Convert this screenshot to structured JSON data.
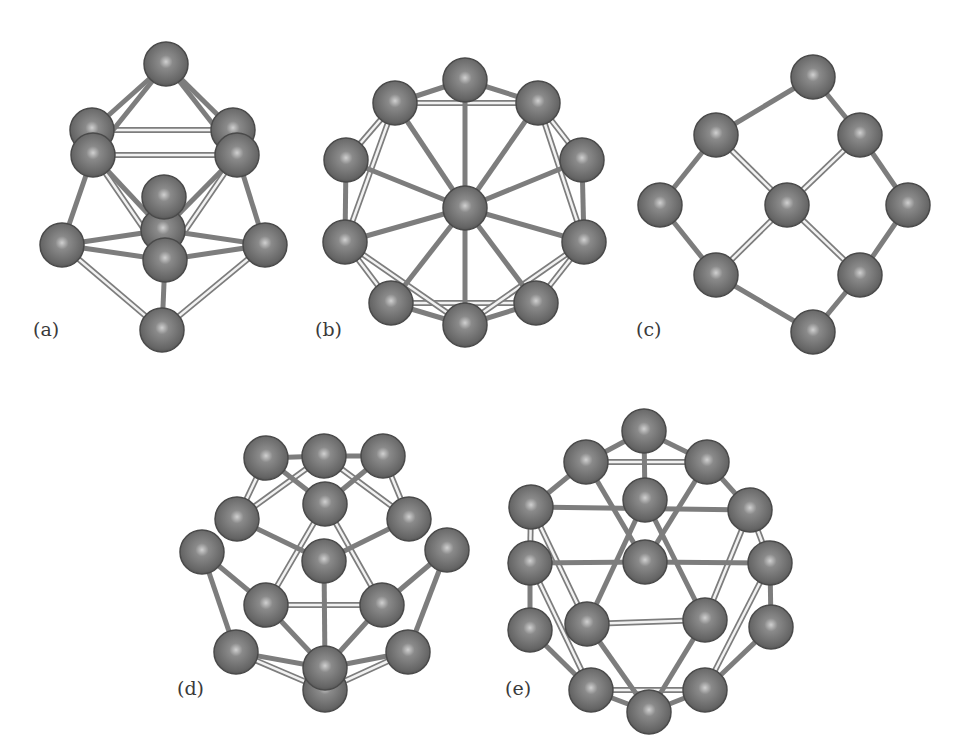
{
  "figure": {
    "colors": {
      "background": "#ffffff",
      "atom_fill": "#6f6f6f",
      "atom_edge": "#4a4a4a",
      "atom_highlight": "#c8c8c8",
      "bond_dark": "#7d7d7d",
      "bond_light": "#bdbdbd",
      "label": "#3a3a3a"
    },
    "atom_radius": 22,
    "panels": [
      {
        "id": "a",
        "label": "(a)",
        "label_pos": [
          33,
          332
        ],
        "atoms": [
          [
            166,
            64
          ],
          [
            92,
            130
          ],
          [
            233,
            130
          ],
          [
            93,
            155
          ],
          [
            237,
            155
          ],
          [
            163,
            230
          ],
          [
            164,
            197
          ],
          [
            62,
            245
          ],
          [
            265,
            245
          ],
          [
            165,
            260
          ],
          [
            162,
            330
          ]
        ],
        "bonds_dark": [
          [
            0,
            3
          ],
          [
            0,
            4
          ],
          [
            0,
            1
          ],
          [
            0,
            2
          ],
          [
            3,
            7
          ],
          [
            4,
            8
          ],
          [
            7,
            9
          ],
          [
            8,
            9
          ],
          [
            7,
            5
          ],
          [
            8,
            5
          ],
          [
            9,
            10
          ],
          [
            3,
            5
          ],
          [
            4,
            5
          ]
        ],
        "bonds_light": [
          [
            1,
            2
          ],
          [
            3,
            4
          ],
          [
            3,
            9
          ],
          [
            4,
            9
          ],
          [
            7,
            10
          ],
          [
            8,
            10
          ]
        ]
      },
      {
        "id": "b",
        "label": "(b)",
        "label_pos": [
          315,
          332
        ],
        "atoms": [
          [
            465,
            208
          ],
          [
            465,
            80
          ],
          [
            395,
            103
          ],
          [
            538,
            103
          ],
          [
            346,
            160
          ],
          [
            582,
            160
          ],
          [
            345,
            242
          ],
          [
            584,
            242
          ],
          [
            391,
            303
          ],
          [
            536,
            303
          ],
          [
            465,
            325
          ]
        ],
        "bonds_dark": [
          [
            0,
            1
          ],
          [
            0,
            2
          ],
          [
            0,
            3
          ],
          [
            0,
            4
          ],
          [
            0,
            5
          ],
          [
            0,
            6
          ],
          [
            0,
            7
          ],
          [
            0,
            8
          ],
          [
            0,
            9
          ],
          [
            0,
            10
          ],
          [
            1,
            2
          ],
          [
            1,
            3
          ],
          [
            4,
            6
          ],
          [
            5,
            7
          ],
          [
            8,
            10
          ],
          [
            9,
            10
          ]
        ],
        "bonds_light": [
          [
            2,
            3
          ],
          [
            2,
            4
          ],
          [
            3,
            5
          ],
          [
            6,
            8
          ],
          [
            7,
            9
          ],
          [
            8,
            9
          ],
          [
            2,
            6
          ],
          [
            3,
            7
          ],
          [
            6,
            10
          ],
          [
            7,
            10
          ]
        ]
      },
      {
        "id": "c",
        "label": "(c)",
        "label_pos": [
          636,
          332
        ],
        "atoms": [
          [
            813,
            77
          ],
          [
            716,
            135
          ],
          [
            860,
            135
          ],
          [
            660,
            205
          ],
          [
            908,
            205
          ],
          [
            787,
            205
          ],
          [
            716,
            275
          ],
          [
            860,
            275
          ],
          [
            813,
            332
          ]
        ],
        "bonds_dark": [
          [
            0,
            1
          ],
          [
            0,
            2
          ],
          [
            1,
            3
          ],
          [
            2,
            4
          ],
          [
            3,
            6
          ],
          [
            4,
            7
          ],
          [
            6,
            8
          ],
          [
            7,
            8
          ]
        ],
        "bonds_light": [
          [
            1,
            5
          ],
          [
            2,
            5
          ],
          [
            6,
            5
          ],
          [
            7,
            5
          ]
        ]
      },
      {
        "id": "d",
        "label": "(d)",
        "label_pos": [
          177,
          691
        ],
        "atoms": [
          [
            266,
            458
          ],
          [
            324,
            456
          ],
          [
            383,
            456
          ],
          [
            325,
            504
          ],
          [
            237,
            519
          ],
          [
            409,
            519
          ],
          [
            202,
            552
          ],
          [
            447,
            550
          ],
          [
            324,
            561
          ],
          [
            266,
            605
          ],
          [
            382,
            605
          ],
          [
            236,
            652
          ],
          [
            408,
            652
          ],
          [
            325,
            690
          ],
          [
            325,
            668
          ]
        ],
        "bonds_dark": [
          [
            0,
            1
          ],
          [
            1,
            2
          ],
          [
            0,
            3
          ],
          [
            2,
            3
          ],
          [
            4,
            8
          ],
          [
            5,
            8
          ],
          [
            6,
            9
          ],
          [
            7,
            10
          ],
          [
            6,
            11
          ],
          [
            7,
            12
          ],
          [
            8,
            14
          ],
          [
            9,
            14
          ],
          [
            10,
            14
          ],
          [
            11,
            14
          ],
          [
            12,
            14
          ]
        ],
        "bonds_light": [
          [
            0,
            4
          ],
          [
            2,
            5
          ],
          [
            1,
            4
          ],
          [
            1,
            5
          ],
          [
            3,
            9
          ],
          [
            3,
            10
          ],
          [
            9,
            10
          ],
          [
            11,
            13
          ],
          [
            12,
            13
          ]
        ]
      },
      {
        "id": "e",
        "label": "(e)",
        "label_pos": [
          505,
          691
        ],
        "atoms": [
          [
            644,
            431
          ],
          [
            586,
            462
          ],
          [
            707,
            462
          ],
          [
            645,
            500
          ],
          [
            531,
            507
          ],
          [
            750,
            510
          ],
          [
            530,
            563
          ],
          [
            645,
            562
          ],
          [
            770,
            563
          ],
          [
            587,
            624
          ],
          [
            705,
            620
          ],
          [
            530,
            630
          ],
          [
            771,
            627
          ],
          [
            649,
            712
          ],
          [
            591,
            690
          ],
          [
            705,
            690
          ]
        ],
        "bonds_dark": [
          [
            0,
            1
          ],
          [
            0,
            2
          ],
          [
            0,
            3
          ],
          [
            1,
            4
          ],
          [
            2,
            5
          ],
          [
            4,
            5
          ],
          [
            6,
            7
          ],
          [
            7,
            8
          ],
          [
            1,
            7
          ],
          [
            2,
            7
          ],
          [
            3,
            9
          ],
          [
            3,
            10
          ],
          [
            9,
            13
          ],
          [
            10,
            13
          ],
          [
            6,
            11
          ],
          [
            8,
            12
          ],
          [
            11,
            14
          ],
          [
            12,
            15
          ],
          [
            14,
            13
          ],
          [
            15,
            13
          ]
        ],
        "bonds_light": [
          [
            1,
            2
          ],
          [
            4,
            6
          ],
          [
            5,
            8
          ],
          [
            9,
            10
          ],
          [
            14,
            15
          ],
          [
            6,
            14
          ],
          [
            8,
            15
          ],
          [
            4,
            9
          ],
          [
            5,
            10
          ]
        ]
      }
    ]
  }
}
